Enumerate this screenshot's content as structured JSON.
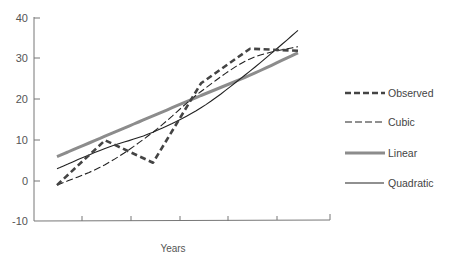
{
  "chart_data": {
    "type": "line",
    "title": "",
    "xlabel": "Years",
    "ylabel": "",
    "ylim": [
      -10,
      40
    ],
    "yticks": [
      40,
      30,
      20,
      10,
      0,
      -10
    ],
    "x": [
      1,
      2,
      3,
      4,
      5,
      6
    ],
    "grid": false,
    "legend_position": "right",
    "series": [
      {
        "name": "Observed",
        "style": "dashed-thick",
        "color": "#444444",
        "values": [
          -1,
          10,
          4.5,
          24,
          32.5,
          32
        ]
      },
      {
        "name": "Cubic",
        "style": "dashed-thin",
        "color": "#222222",
        "values": [
          -1,
          4,
          12,
          22,
          30,
          33
        ]
      },
      {
        "name": "Linear",
        "style": "solid-thick",
        "color": "#8c8c8c",
        "values": [
          6,
          11,
          16,
          21,
          26,
          31.5
        ]
      },
      {
        "name": "Quadratic",
        "style": "solid-thin",
        "color": "#222222",
        "values": [
          3,
          8,
          12,
          18,
          27,
          37
        ]
      }
    ]
  },
  "labels": {
    "y_ticks": [
      "40",
      "30",
      "20",
      "10",
      "0",
      "-10"
    ],
    "x_title": "Years",
    "legend": [
      "Observed",
      "Cubic",
      "Linear",
      "Quadratic"
    ]
  }
}
